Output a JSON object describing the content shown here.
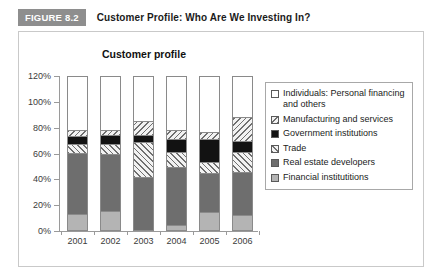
{
  "figure": {
    "badge": "FIGURE 8.2",
    "title": "Customer Profile: Who Are We Investing In?"
  },
  "chart_data": {
    "type": "bar",
    "stacked": true,
    "title": "Customer profile",
    "xlabel": "",
    "ylabel": "",
    "ylim": [
      0,
      120
    ],
    "grid": false,
    "legend_position": "right",
    "categories": [
      "2001",
      "2002",
      "2003",
      "2004",
      "2005",
      "2006"
    ],
    "ytick_labels": [
      "0%",
      "20%",
      "40%",
      "60%",
      "80%",
      "100%",
      "120%"
    ],
    "ytick_values": [
      0,
      20,
      40,
      60,
      80,
      100,
      120
    ],
    "series": [
      {
        "name": "Financial institutitions",
        "key": "financial",
        "pattern": "solid-light-gray",
        "color": "#b4b4b4",
        "values": [
          12,
          14,
          0,
          3,
          13,
          11
        ]
      },
      {
        "name": "Real estate developers",
        "key": "realestate",
        "pattern": "solid-dark-gray",
        "color": "#6e6e6e",
        "values": [
          47,
          44,
          40,
          45,
          30,
          33
        ]
      },
      {
        "name": "Trade",
        "key": "trade",
        "pattern": "diagonal-hatch-up",
        "color": "#f2f2f2",
        "values": [
          7,
          8,
          27,
          12,
          9,
          16
        ]
      },
      {
        "name": "Government institutions",
        "key": "government",
        "pattern": "solid-black",
        "color": "#121212",
        "values": [
          6,
          7,
          6,
          10,
          18,
          8
        ]
      },
      {
        "name": "Manufacturing and services",
        "key": "manufacturing",
        "pattern": "diagonal-hatch-down",
        "color": "#f2f2f2",
        "values": [
          5,
          4,
          11,
          7,
          5,
          19
        ]
      },
      {
        "name": "Individuals: Personal financing and others",
        "key": "individuals",
        "pattern": "white",
        "color": "#ffffff",
        "values": [
          23,
          23,
          16,
          23,
          25,
          13
        ]
      }
    ],
    "legend_entries": [
      {
        "label": "Individuals: Personal financing and others",
        "key": "individuals"
      },
      {
        "label": "Manufacturing and services",
        "key": "manufacturing"
      },
      {
        "label": "Government institutions",
        "key": "government"
      },
      {
        "label": "Trade",
        "key": "trade"
      },
      {
        "label": "Real estate developers",
        "key": "realestate"
      },
      {
        "label": "Financial institutitions",
        "key": "financial"
      }
    ]
  }
}
